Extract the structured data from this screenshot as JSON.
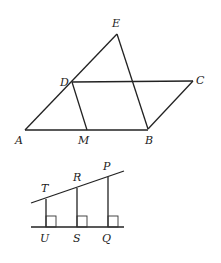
{
  "figure1": {
    "labels": {
      "E": "E",
      "D": "D",
      "C": "C",
      "A": "A",
      "M": "M",
      "B": "B"
    }
  },
  "figure2": {
    "labels": {
      "T": "T",
      "R": "R",
      "P": "P",
      "U": "U",
      "S": "S",
      "Q": "Q"
    }
  }
}
